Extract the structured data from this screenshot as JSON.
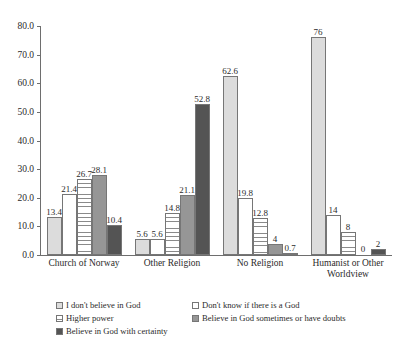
{
  "chart_data": {
    "type": "bar",
    "title": "",
    "xlabel": "",
    "ylabel": "",
    "ylim": [
      0,
      80
    ],
    "ytick_step": 10,
    "ytick_labels": [
      "0.0",
      "10.0",
      "20.0",
      "30.0",
      "40.0",
      "50.0",
      "60.0",
      "70.0",
      "80.0"
    ],
    "grid": false,
    "legend_position": "bottom",
    "categories": [
      "Church of Norway",
      "Other Religion",
      "No Religion",
      "Humanist or Other Worldview"
    ],
    "category_lines": [
      [
        "Church of Norway"
      ],
      [
        "Other Religion"
      ],
      [
        "No Religion"
      ],
      [
        "Humanist or Other",
        "Worldview"
      ]
    ],
    "series": [
      {
        "name": "I don't believe in God",
        "fill": "light-gray-solid",
        "values": [
          13.4,
          5.6,
          62.6,
          76
        ],
        "labels": [
          "13.4",
          "5.6",
          "62.6",
          "76"
        ]
      },
      {
        "name": "Don't know if there is a God",
        "fill": "white",
        "values": [
          21.4,
          5.6,
          19.8,
          14
        ],
        "labels": [
          "21.4",
          "5.6",
          "19.8",
          "14"
        ]
      },
      {
        "name": "Higher power",
        "fill": "white-grid-lines",
        "values": [
          26.7,
          14.8,
          12.8,
          8
        ],
        "labels": [
          "26.7",
          "14.8",
          "12.8",
          "8"
        ]
      },
      {
        "name": "Believe in God sometimes or have doubts",
        "fill": "medium-gray",
        "values": [
          28.1,
          21.1,
          4,
          0
        ],
        "labels": [
          "28.1",
          "21.1",
          "4",
          "0"
        ]
      },
      {
        "name": "Believe in God with certainty",
        "fill": "dark-gray",
        "values": [
          10.4,
          52.8,
          0.7,
          2
        ],
        "labels": [
          "10.4",
          "52.8",
          "0.7",
          "2"
        ]
      }
    ]
  },
  "legend": {
    "rows": [
      [
        {
          "label": "I don't believe in God",
          "series": 0
        },
        {
          "label": "Don't know if there is a God",
          "series": 1
        }
      ],
      [
        {
          "label": "Higher power",
          "series": 2
        },
        {
          "label": "Believe in God sometimes or have doubts",
          "series": 3
        }
      ],
      [
        {
          "label": "Believe in God with certainty",
          "series": 4
        }
      ]
    ]
  }
}
